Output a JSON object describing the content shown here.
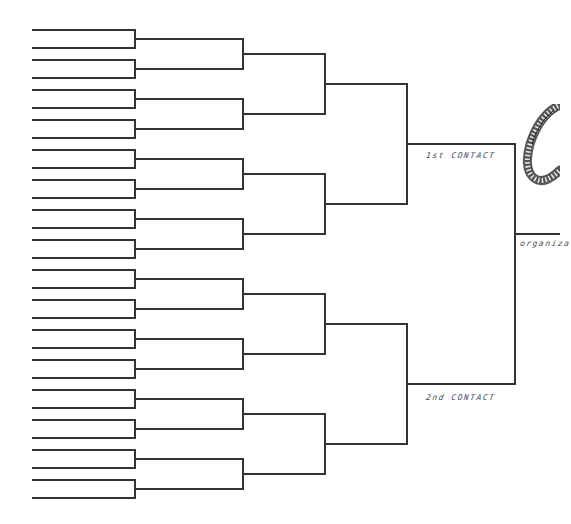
{
  "diagram": {
    "type": "single-elimination bracket",
    "entrants": 32,
    "rounds": 6,
    "line_color": "#333333",
    "background": "#ffffff"
  },
  "geometry": {
    "entry_x_start": 33,
    "round_x": [
      135,
      243,
      325,
      407,
      515
    ],
    "final_x_end": 560,
    "first_entry_y": 30,
    "pair_gap": 18,
    "pair_spacing": 30,
    "final_output_y": 234
  },
  "labels": {
    "first_contact": "1st CONTACT",
    "second_contact": "2nd CONTACT",
    "final": "organiza"
  },
  "decorations": {
    "coil_drawing": "coiled-cord-icon"
  }
}
